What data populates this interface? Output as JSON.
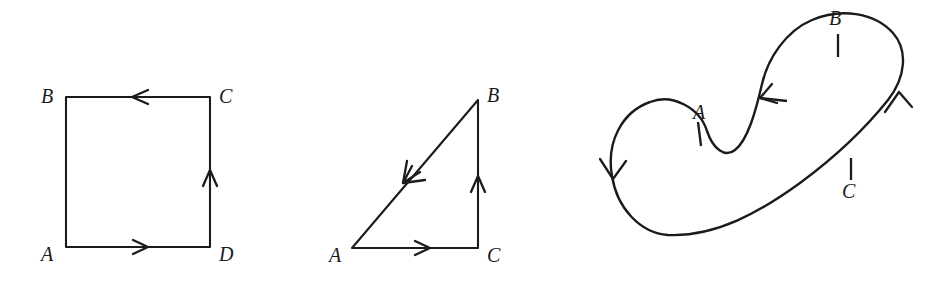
{
  "figure": {
    "background_color": "#ffffff",
    "ink_color": "#1b1b1b",
    "panels": [
      {
        "id": "square",
        "name": "oriented-square",
        "shape": "square",
        "vertices": [
          {
            "label": "A",
            "x": 66,
            "y": 247,
            "label_x": 41,
            "label_y": 261
          },
          {
            "label": "B",
            "x": 66,
            "y": 97,
            "label_x": 41,
            "label_y": 103
          },
          {
            "label": "C",
            "x": 210,
            "y": 97,
            "label_x": 219,
            "label_y": 103
          },
          {
            "label": "D",
            "x": 210,
            "y": 247,
            "label_x": 219,
            "label_y": 261
          }
        ],
        "orientation": "A -> D -> C -> B -> A",
        "arrow_count": 3,
        "arrows": [
          {
            "name": "bottom-edge-arrow",
            "direction": "right",
            "x": 142,
            "y": 247
          },
          {
            "name": "right-edge-arrow",
            "direction": "up",
            "x": 210,
            "y": 176
          },
          {
            "name": "top-edge-arrow",
            "direction": "left",
            "x": 139,
            "y": 97
          }
        ]
      },
      {
        "id": "triangle",
        "name": "oriented-triangle",
        "shape": "right-triangle",
        "vertices": [
          {
            "label": "A",
            "x": 352,
            "y": 248,
            "label_x": 329,
            "label_y": 262
          },
          {
            "label": "B",
            "x": 478,
            "y": 100,
            "label_x": 487,
            "label_y": 102
          },
          {
            "label": "C",
            "x": 478,
            "y": 248,
            "label_x": 487,
            "label_y": 262
          }
        ],
        "orientation": "A -> C -> B -> A",
        "arrow_count": 3,
        "arrows": [
          {
            "name": "base-edge-arrow",
            "direction": "right",
            "x": 424,
            "y": 248
          },
          {
            "name": "vertical-edge-arrow",
            "direction": "up",
            "x": 478,
            "y": 182
          },
          {
            "name": "hypotenuse-arrow",
            "direction": "down-left",
            "x": 409,
            "y": 176
          }
        ]
      },
      {
        "id": "closed-curve",
        "name": "oriented-closed-curve",
        "shape": "closed-s-curve",
        "points": [
          {
            "label": "A",
            "x": 700,
            "y": 133,
            "label_x": 693,
            "label_y": 119
          },
          {
            "label": "B",
            "x": 838,
            "y": 45,
            "label_x": 829,
            "label_y": 25
          },
          {
            "label": "C",
            "x": 851,
            "y": 168,
            "label_x": 842,
            "label_y": 198
          }
        ],
        "tick_count": 3,
        "arrow_count": 3,
        "arrows": [
          {
            "name": "left-lobe-arrow",
            "direction": "down",
            "x": 613,
            "y": 172
          },
          {
            "name": "middle-arrow",
            "direction": "down-left",
            "x": 769,
            "y": 98
          },
          {
            "name": "right-lobe-arrow",
            "direction": "up",
            "x": 898,
            "y": 96
          }
        ]
      }
    ]
  }
}
